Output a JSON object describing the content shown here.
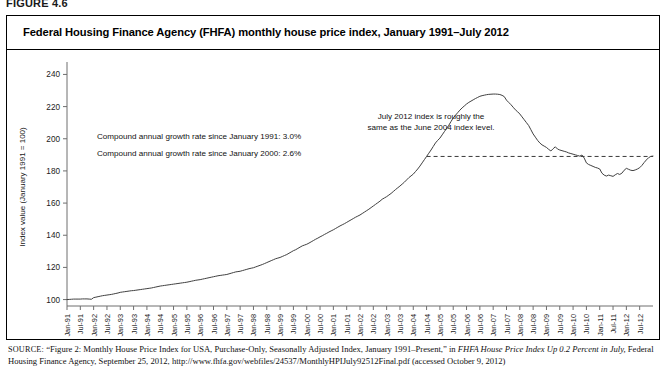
{
  "figure": {
    "number": "FIGURE 4.6",
    "title": "Federal Housing Finance Agency (FHFA) monthly house price index, January 1991–July 2012"
  },
  "annotations": {
    "cagr_1991": "Compound annual growth rate since January 1991: 3.0%",
    "cagr_2000": "Compound annual growth rate since January 2000: 2.6%",
    "reference_line_note_1": "July 2012 index is roughly the",
    "reference_line_note_2": "same as the June 2004 index level."
  },
  "source": {
    "label": "SOURCE:",
    "line1_a": "“Figure 2: Monthly House Price Index for USA, Purchase-Only, Seasonally Adjusted Index, January 1991–Present,” in ",
    "line1_italic": "FHFA House Price Index Up 0.2 Percent in July,",
    "line2_a": " Federal Housing Finance Agency, September 25, 2012, http://www.fhfa.gov/webfiles/24537/MonthlyHPIJuly92512Final.pdf (accessed October 9, 2012)"
  },
  "colors": {
    "line": "#404040",
    "axis": "#6e6e6e",
    "text": "#111111",
    "frame": "#000000"
  },
  "chart_data": {
    "type": "line",
    "title": "Federal Housing Finance Agency (FHFA) monthly house price index, January 1991–July 2012",
    "xlabel": "",
    "ylabel": "Index value (January 1991 = 100)",
    "ylim": [
      96,
      244
    ],
    "yticks": [
      100,
      120,
      140,
      160,
      180,
      200,
      220,
      240
    ],
    "grid": false,
    "legend": "none",
    "xlim_labels": [
      "Jan-91",
      "Jul-12"
    ],
    "xtick_labels": [
      "Jan-91",
      "Jul-91",
      "Jan-92",
      "Jul-92",
      "Jan-93",
      "Jul-93",
      "Jan-94",
      "Jul-94",
      "Jan-95",
      "Jul-95",
      "Jan-96",
      "Jul-96",
      "Jan-97",
      "Jul-97",
      "Jan-98",
      "Jul-98",
      "Jan-99",
      "Jul-99",
      "Jan-00",
      "Jul-00",
      "Jan-01",
      "Jul-01",
      "Jan-02",
      "Jul-02",
      "Jan-03",
      "Jul-03",
      "Jan-04",
      "Jul-04",
      "Jan-05",
      "Jul-05",
      "Jan-06",
      "Jul-06",
      "Jan-07",
      "Jul-07",
      "Jan-08",
      "Jul-08",
      "Jan-09",
      "Jul-09",
      "Jan-10",
      "Jul-10",
      "Jan-11",
      "Jul-11",
      "Jan-12",
      "Jul-12"
    ],
    "reference_line": {
      "value": 189,
      "label": "June 2004 index level",
      "from_x": "Jul-04",
      "to_x": "Jul-12"
    },
    "series": [
      {
        "name": "FHFA monthly house price index (purchase-only, seasonally adjusted)",
        "x": [
          "Jan-91",
          "Jul-91",
          "Jan-92",
          "Jul-92",
          "Jan-93",
          "Jul-93",
          "Jan-94",
          "Jul-94",
          "Jan-95",
          "Jul-95",
          "Jan-96",
          "Jul-96",
          "Jan-97",
          "Jul-97",
          "Jan-98",
          "Jul-98",
          "Jan-99",
          "Jul-99",
          "Jan-00",
          "Jul-00",
          "Jan-01",
          "Jul-01",
          "Jan-02",
          "Jul-02",
          "Jan-03",
          "Jul-03",
          "Jan-04",
          "Jul-04",
          "Jan-05",
          "Jul-05",
          "Jan-06",
          "Jul-06",
          "Jan-07",
          "Jul-07",
          "Jan-08",
          "Jul-08",
          "Jan-09",
          "Jul-09",
          "Jan-10",
          "Jul-10",
          "Jan-11",
          "Jul-11",
          "Jan-12",
          "Jul-12"
        ],
        "values": [
          100.0,
          100.3,
          101.2,
          103.0,
          104.5,
          105.6,
          106.8,
          108.4,
          109.6,
          110.8,
          112.4,
          114.2,
          115.6,
          117.6,
          119.8,
          123.0,
          126.2,
          130.4,
          134.4,
          139.0,
          143.4,
          148.0,
          152.6,
          158.2,
          164.0,
          170.6,
          178.0,
          189.0,
          200.4,
          213.0,
          221.6,
          226.4,
          227.8,
          224.0,
          215.4,
          203.0,
          194.6,
          193.0,
          190.4,
          185.0,
          181.2,
          181.6,
          182.0,
          189.2
        ],
        "monthly_values": [
          100.0,
          100.1,
          100.2,
          100.3,
          100.3,
          100.3,
          100.3,
          100.4,
          100.4,
          100.4,
          100.3,
          100.2,
          101.2,
          101.5,
          101.8,
          102.1,
          102.4,
          102.6,
          102.8,
          103.0,
          103.2,
          103.5,
          103.8,
          104.1,
          104.5,
          104.7,
          104.9,
          105.1,
          105.3,
          105.5,
          105.6,
          105.8,
          106.0,
          106.2,
          106.4,
          106.6,
          106.8,
          107.0,
          107.2,
          107.5,
          107.8,
          108.1,
          108.4,
          108.6,
          108.8,
          109.0,
          109.2,
          109.4,
          109.6,
          109.8,
          110.0,
          110.2,
          110.4,
          110.6,
          110.8,
          111.1,
          111.4,
          111.7,
          112.0,
          112.2,
          112.4,
          112.7,
          113.0,
          113.3,
          113.6,
          113.9,
          114.2,
          114.5,
          114.8,
          115.0,
          115.2,
          115.4,
          115.6,
          116.0,
          116.4,
          116.8,
          117.2,
          117.4,
          117.6,
          118.0,
          118.4,
          118.8,
          119.2,
          119.5,
          119.8,
          120.3,
          120.8,
          121.3,
          121.8,
          122.4,
          123.0,
          123.6,
          124.2,
          124.8,
          125.4,
          125.8,
          126.2,
          126.8,
          127.4,
          128.0,
          128.8,
          129.6,
          130.4,
          131.0,
          131.8,
          132.6,
          133.4,
          133.9,
          134.4,
          135.1,
          135.9,
          136.7,
          137.5,
          138.2,
          139.0,
          139.7,
          140.5,
          141.2,
          142.0,
          142.7,
          143.4,
          144.2,
          145.0,
          145.8,
          146.5,
          147.2,
          148.0,
          148.8,
          149.6,
          150.4,
          151.2,
          151.9,
          152.6,
          153.5,
          154.4,
          155.3,
          156.2,
          157.2,
          158.2,
          159.2,
          160.2,
          161.2,
          162.4,
          163.2,
          164.0,
          165.0,
          166.0,
          167.2,
          168.4,
          169.5,
          170.6,
          171.8,
          173.0,
          174.4,
          175.8,
          176.9,
          178.0,
          179.6,
          181.2,
          183.0,
          185.0,
          187.0,
          189.0,
          191.0,
          193.0,
          195.2,
          197.4,
          199.0,
          200.4,
          202.4,
          204.4,
          206.4,
          208.4,
          210.7,
          213.0,
          214.6,
          216.2,
          217.8,
          219.2,
          220.4,
          221.6,
          222.6,
          223.4,
          224.2,
          225.0,
          225.7,
          226.4,
          226.8,
          227.1,
          227.4,
          227.6,
          227.7,
          227.8,
          227.8,
          227.7,
          227.5,
          227.0,
          226.2,
          224.0,
          222.6,
          221.2,
          219.6,
          218.0,
          216.8,
          215.4,
          213.6,
          211.8,
          210.0,
          208.2,
          205.6,
          203.0,
          201.0,
          199.0,
          197.4,
          196.2,
          195.4,
          194.6,
          193.4,
          192.4,
          193.8,
          195.0,
          193.6,
          193.0,
          192.6,
          192.2,
          191.8,
          191.2,
          190.8,
          190.4,
          190.0,
          189.6,
          189.2,
          189.9,
          188.0,
          185.0,
          184.0,
          183.4,
          182.8,
          182.2,
          181.8,
          181.2,
          178.6,
          177.4,
          176.8,
          177.4,
          177.0,
          176.6,
          177.6,
          178.4,
          177.8,
          178.6,
          180.4,
          181.6,
          181.0,
          180.4,
          180.2,
          180.6,
          181.2,
          182.0,
          183.4,
          185.2,
          186.8,
          188.2,
          189.0,
          189.2
        ]
      }
    ]
  }
}
